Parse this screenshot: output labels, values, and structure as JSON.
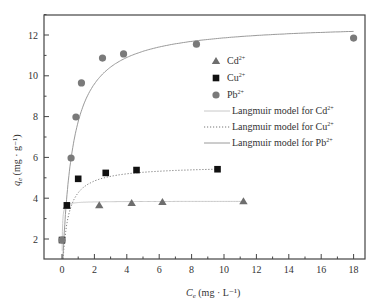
{
  "chart_data": {
    "type": "scatter",
    "title": "",
    "xlabel": "Ce (mg · L⁻¹)",
    "xlabel_main": "C",
    "xlabel_sub": "e",
    "xlabel_unit": " (mg · L⁻¹)",
    "ylabel": "qe (mg · g⁻¹)",
    "ylabel_main": "q",
    "ylabel_sub": "e",
    "ylabel_unit": " (mg · g⁻¹)",
    "xlim": [
      -1.1,
      18.7
    ],
    "ylim": [
      1,
      13
    ],
    "xticks": [
      0,
      2,
      4,
      6,
      8,
      10,
      12,
      14,
      16,
      18
    ],
    "yticks": [
      2,
      4,
      6,
      8,
      10,
      12
    ],
    "grid": false,
    "legend_position": "upper right (inside)",
    "series": [
      {
        "name": "Cd²⁺",
        "marker": "triangle",
        "color": "#6e6e6e",
        "points": [
          [
            0.3,
            3.62
          ],
          [
            2.3,
            3.66
          ],
          [
            4.3,
            3.76
          ],
          [
            6.2,
            3.81
          ],
          [
            11.2,
            3.85
          ]
        ]
      },
      {
        "name": "Cu²⁺",
        "marker": "square",
        "color": "#111111",
        "points": [
          [
            0.0,
            1.95
          ],
          [
            0.3,
            3.65
          ],
          [
            1.0,
            4.95
          ],
          [
            2.7,
            5.24
          ],
          [
            4.6,
            5.38
          ],
          [
            9.6,
            5.42
          ]
        ]
      },
      {
        "name": "Pb²⁺",
        "marker": "circle",
        "color": "#7a7a7a",
        "points": [
          [
            0.0,
            1.95
          ],
          [
            0.56,
            5.97
          ],
          [
            0.86,
            7.98
          ],
          [
            1.2,
            9.65
          ],
          [
            2.5,
            10.87
          ],
          [
            3.8,
            11.07
          ],
          [
            8.3,
            11.55
          ],
          [
            18.0,
            11.85
          ]
        ]
      }
    ],
    "fits": [
      {
        "name": "Langmuir model for Cd²⁺",
        "style": "solid-light",
        "color": "#c8c8c8",
        "qm": 3.85,
        "K": 60,
        "xmin": 0.0,
        "xmax": 11.2
      },
      {
        "name": "Langmuir model for Cu²⁺",
        "style": "dotted",
        "color": "#777777",
        "qm": 5.6,
        "K": 3.2,
        "xmin": 0.0,
        "xmax": 9.6
      },
      {
        "name": "Langmuir model for Pb²⁺",
        "style": "solid",
        "color": "#9a9a9a",
        "qm": 12.6,
        "K": 1.6,
        "xmin": 0.0,
        "xmax": 18.0
      }
    ]
  },
  "legend": {
    "items": [
      {
        "label_main": "Cd",
        "label_sup": "2+",
        "kind": "triangle"
      },
      {
        "label_main": "Cu",
        "label_sup": "2+",
        "kind": "square"
      },
      {
        "label_main": "Pb",
        "label_sup": "2+",
        "kind": "circle"
      },
      {
        "label_main": "Langmuir model for Cd",
        "label_sup": "2+",
        "kind": "line-light"
      },
      {
        "label_main": "Langmuir model for Cu",
        "label_sup": "2+",
        "kind": "line-dotted"
      },
      {
        "label_main": "Langmuir model for Pb",
        "label_sup": "2+",
        "kind": "line-solid"
      }
    ]
  }
}
